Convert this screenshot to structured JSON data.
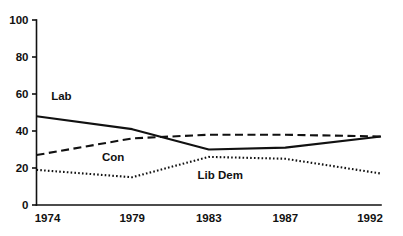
{
  "chart_data": {
    "type": "line",
    "title": "",
    "xlabel": "",
    "ylabel": "",
    "x": [
      1974,
      1979,
      1983,
      1987,
      1992
    ],
    "xtick_labels": [
      "1974",
      "1979",
      "1983",
      "1987",
      "1992"
    ],
    "ytick_labels": [
      "0",
      "20",
      "40",
      "60",
      "80",
      "100"
    ],
    "yticks": [
      0,
      20,
      40,
      60,
      80,
      100
    ],
    "ylim": [
      0,
      100
    ],
    "xlim": [
      1974,
      1992
    ],
    "grid": false,
    "legend_position": "inline-labels",
    "series": [
      {
        "name": "Lab",
        "label": "Lab",
        "style": "solid",
        "color": "#111111",
        "width": 2.1,
        "values": [
          48,
          41,
          30,
          31,
          37
        ],
        "label_x": 1975.3,
        "label_y": 57
      },
      {
        "name": "Con",
        "label": "Con",
        "style": "dashed",
        "color": "#111111",
        "width": 2.1,
        "values": [
          27,
          36,
          38,
          38,
          37
        ],
        "label_x": 1978.0,
        "label_y": 24
      },
      {
        "name": "Lib Dem",
        "label": "Lib Dem",
        "style": "dotted",
        "color": "#111111",
        "width": 2.1,
        "values": [
          19,
          15,
          26,
          25,
          17
        ],
        "label_x": 1983.6,
        "label_y": 14
      }
    ]
  }
}
